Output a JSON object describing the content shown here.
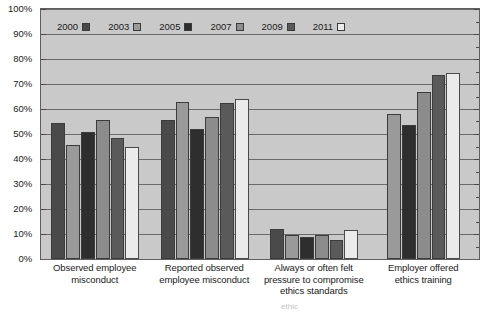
{
  "chart_data": {
    "type": "bar",
    "title": "",
    "subtitle": "",
    "xlabel": "",
    "ylabel": "",
    "ylim": [
      0,
      100
    ],
    "ytick_step": 10,
    "ytick_labels": [
      "0%",
      "10%",
      "20%",
      "30%",
      "40%",
      "50%",
      "60%",
      "70%",
      "80%",
      "90%",
      "100%"
    ],
    "grid": true,
    "legend_position": "top-left inside plot",
    "categories": [
      "Observed employee misconduct",
      "Reported observed employee misconduct",
      "Always or often felt pressure to compromise ethics standards",
      "Employer offered ethics training"
    ],
    "series": [
      {
        "name": "2000",
        "color": "#4a4a4a",
        "values": [
          54.5,
          55.5,
          12.0,
          null
        ]
      },
      {
        "name": "2003",
        "color": "#9a9a9a",
        "values": [
          45.5,
          63.0,
          9.5,
          58.0
        ]
      },
      {
        "name": "2005",
        "color": "#2e2e2e",
        "values": [
          51.0,
          52.0,
          9.0,
          53.5
        ]
      },
      {
        "name": "2007",
        "color": "#8c8c8c",
        "values": [
          55.5,
          57.0,
          9.5,
          67.0
        ]
      },
      {
        "name": "2009",
        "color": "#5a5a5a",
        "values": [
          48.5,
          62.5,
          7.5,
          73.5
        ]
      },
      {
        "name": "2011",
        "color": "#ebebeb",
        "values": [
          45.0,
          64.0,
          11.5,
          74.5
        ]
      }
    ]
  },
  "legend": {
    "items": [
      {
        "label": "2000"
      },
      {
        "label": "2003"
      },
      {
        "label": "2005"
      },
      {
        "label": "2007"
      },
      {
        "label": "2009"
      },
      {
        "label": "2011"
      }
    ]
  },
  "x_labels": [
    {
      "lines": [
        "Observed employee",
        "misconduct"
      ]
    },
    {
      "lines": [
        "Reported observed",
        "employee misconduct"
      ]
    },
    {
      "lines": [
        "Always or often felt",
        "pressure to compromise",
        "ethics standards"
      ]
    },
    {
      "lines": [
        "Employer offered",
        "ethics training"
      ]
    }
  ],
  "source_line": "ethic",
  "style": {
    "plot_background": "#c9c9c9",
    "page_background": "#ffffff",
    "gridline_color": "#6a6a6a",
    "axis_color": "#5f5f5f",
    "text_color": "#1a1a1a"
  }
}
